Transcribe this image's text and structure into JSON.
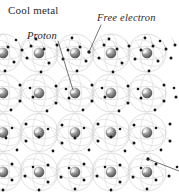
{
  "figure": {
    "background_color": "#ffffff",
    "width": 179,
    "height": 193
  },
  "labels": {
    "cool_metal": "Cool metal",
    "proton": "Proton",
    "free_electron": "Free electron"
  },
  "colors": {
    "label_text": "#2b2b2b",
    "nucleus_dark": "#555555",
    "nucleus_mid": "#8f8f8f",
    "nucleus_light": "#d8d8d8",
    "nucleus_highlight": "#f2f2f2",
    "electron": "#151515",
    "orbit_ring": "#b9b9b9",
    "trail": "#b0b0b0",
    "leader_line": "#3a3a3a"
  },
  "lattice": {
    "description": "Regular array of positive metal ion cores (protons) each encircled by thin electron orbit rings, with free electrons drifting between them",
    "nucleus_radius_px": 5.2,
    "orbit_radius_px": 19,
    "column_spacing_px": 36,
    "row_spacing_px": 39.5,
    "row_y": [
      53,
      93,
      132.5,
      172
    ],
    "column_x": [
      3,
      39,
      75,
      111,
      147
    ],
    "column_x_offset_rows": [
      21,
      57,
      93,
      129,
      165
    ],
    "nuclei_count": 20,
    "free_electron_count": 118,
    "electron_radius_px": 1.5,
    "electron_trail_length_px": 9
  },
  "leaders": [
    {
      "name": "proton-leader",
      "from_x": 58,
      "from_y": 41,
      "to_x": 73,
      "to_y": 90
    },
    {
      "name": "free-electron-leader",
      "from_x": 101,
      "from_y": 25,
      "to_x": 89,
      "to_y": 52
    },
    {
      "name": "bottom-right-leader",
      "from_x": 179,
      "from_y": 171,
      "to_x": 148,
      "to_y": 159
    }
  ]
}
